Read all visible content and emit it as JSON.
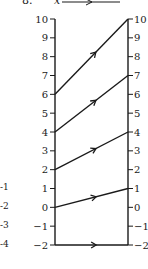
{
  "header": {
    "problem_number": "8.",
    "variable": "x"
  },
  "left_fragment_labels": [
    "-1",
    "-2",
    "-3",
    "-4"
  ],
  "diagram": {
    "type": "mapping-diagram",
    "axis_range": [
      -2,
      10
    ],
    "left_axis_ticks": [
      -2,
      -1,
      0,
      1,
      2,
      3,
      4,
      5,
      6,
      7,
      8,
      9,
      10
    ],
    "right_axis_ticks": [
      -2,
      -1,
      0,
      1,
      2,
      3,
      4,
      5,
      6,
      7,
      8,
      9,
      10
    ],
    "mappings": [
      {
        "from": 6,
        "to": 10
      },
      {
        "from": 4,
        "to": 7
      },
      {
        "from": 2,
        "to": 4
      },
      {
        "from": 0,
        "to": 1
      },
      {
        "from": -2,
        "to": -2
      }
    ]
  }
}
